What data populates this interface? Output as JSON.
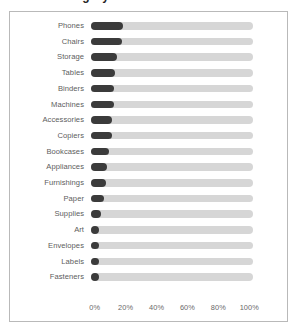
{
  "title": {
    "text": "Sub-Category"
  },
  "colors": {
    "bar": "#3b3b3b",
    "track": "#d6d6d6",
    "label": "#5d5d5d",
    "axis_label": "#6a6a6a",
    "frame_border": "#b9b9b9",
    "background": "#ffffff"
  },
  "chart_data": {
    "type": "bar",
    "orientation": "horizontal",
    "title": "Sub-Category",
    "xlabel": "",
    "ylabel": "",
    "xlim": [
      0,
      100
    ],
    "grid": false,
    "legend": "none",
    "value_suffix": "%",
    "tick_labels": [
      "0%",
      "20%",
      "40%",
      "60%",
      "80%",
      "100%"
    ],
    "tick_values": [
      0,
      20,
      40,
      60,
      80,
      100
    ],
    "categories": [
      "Phones",
      "Chairs",
      "Storage",
      "Tables",
      "Binders",
      "Machines",
      "Accessories",
      "Copiers",
      "Bookcases",
      "Appliances",
      "Furnishings",
      "Paper",
      "Supplies",
      "Art",
      "Envelopes",
      "Labels",
      "Fasteners"
    ],
    "values": [
      20,
      19,
      16,
      15,
      14,
      14,
      13,
      13,
      11,
      10,
      9,
      8,
      6,
      5,
      4,
      4,
      3
    ]
  }
}
